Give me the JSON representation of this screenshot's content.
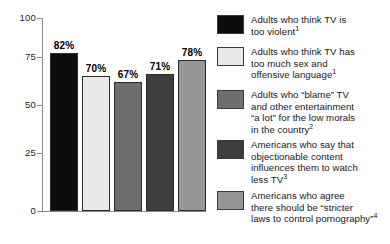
{
  "chart_data": {
    "type": "bar",
    "title": "",
    "subtitle": "",
    "xlabel": "",
    "ylabel": "",
    "ylim": [
      0,
      100
    ],
    "yticks": [
      0,
      25,
      50,
      75,
      100
    ],
    "ytick_labels": [
      "0",
      "25",
      "50",
      "75",
      "100"
    ],
    "grid": false,
    "legend_position": "right",
    "categories": [
      "Adults who think TV is too violent",
      "Adults who think TV has too much sex and offensive language",
      "Adults who \"blame\" TV and other entertainment \"a lot\" for the low morals in the country",
      "Americans who say that objectionable content influences them to watch less TV",
      "Americans who agree there should be \"stricter laws to control pornography\""
    ],
    "values": [
      82,
      70,
      67,
      71,
      78
    ],
    "value_labels": [
      "82%",
      "70%",
      "67%",
      "71%",
      "78%"
    ],
    "colors": [
      "#0d0d0d",
      "#e9e9e9",
      "#6e6e6e",
      "#3d3d3d",
      "#969696"
    ]
  },
  "axis": {
    "tick_100": "100",
    "tick_75": "75",
    "tick_50": "50",
    "tick_25": "25",
    "tick_0": "0"
  },
  "bars": [
    {
      "value_label": "82%",
      "color": "#0d0d0d",
      "value": 82
    },
    {
      "value_label": "70%",
      "color": "#e9e9e9",
      "value": 70
    },
    {
      "value_label": "67%",
      "color": "#6e6e6e",
      "value": 67
    },
    {
      "value_label": "71%",
      "color": "#3d3d3d",
      "value": 71
    },
    {
      "value_label": "78%",
      "color": "#969696",
      "value": 78
    }
  ],
  "legend": {
    "items": [
      {
        "color": "#0d0d0d",
        "line1": "Adults who think TV is",
        "line2": "too violent",
        "line3": "",
        "line4": "",
        "footnote": "1"
      },
      {
        "color": "#e9e9e9",
        "line1": "Adults who think TV has",
        "line2": "too much sex and",
        "line3": "offensive language",
        "line4": "",
        "footnote": "1"
      },
      {
        "color": "#6e6e6e",
        "line1": "Adults who “blame” TV",
        "line2": "and other entertainment",
        "line3": "“a lot” for the low morals",
        "line4": "in the country",
        "footnote": "2"
      },
      {
        "color": "#3d3d3d",
        "line1": "Americans who say that",
        "line2": "objectionable content",
        "line3": "influences them to watch",
        "line4": "less TV",
        "footnote": "3"
      },
      {
        "color": "#969696",
        "line1": "Americans who agree",
        "line2": "there should be “stricter",
        "line3": "laws to control pornography”",
        "line4": "",
        "footnote": "4"
      }
    ]
  }
}
